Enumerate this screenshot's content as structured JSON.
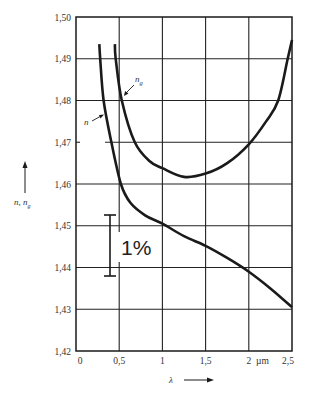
{
  "chart_data": {
    "type": "line",
    "title": "",
    "xlabel": "λ",
    "xunit": "µm",
    "ylabel": "n, n_g",
    "xlim": [
      0,
      2.5
    ],
    "ylim": [
      1.42,
      1.5
    ],
    "grid": true,
    "legend": "inline labels with arrows",
    "x_ticks": [
      "0",
      "0,5",
      "1",
      "1,5",
      "2",
      "2,5"
    ],
    "x_tick_values": [
      0,
      0.5,
      1,
      1.5,
      2,
      2.5
    ],
    "y_ticks": [
      "1,42",
      "1,43",
      "1,44",
      "1,45",
      "1,46",
      "1,47",
      "1,48",
      "1,49",
      "1,50"
    ],
    "y_tick_values": [
      1.42,
      1.43,
      1.44,
      1.45,
      1.46,
      1.47,
      1.48,
      1.49,
      1.5
    ],
    "series": [
      {
        "name": "n",
        "label": "n",
        "x": [
          0.27,
          0.28,
          0.32,
          0.41,
          0.52,
          0.63,
          0.8,
          1.0,
          1.25,
          1.5,
          1.75,
          2.0,
          2.25,
          2.5
        ],
        "y": [
          1.4935,
          1.49,
          1.48,
          1.47,
          1.46,
          1.4555,
          1.4525,
          1.4505,
          1.4475,
          1.4452,
          1.4423,
          1.439,
          1.435,
          1.4305
        ]
      },
      {
        "name": "n_g",
        "label": "n",
        "label_sub": "g",
        "x": [
          0.45,
          0.46,
          0.53,
          0.68,
          0.85,
          1.0,
          1.25,
          1.5,
          1.75,
          2.0,
          2.2,
          2.34,
          2.45,
          2.5
        ],
        "y": [
          1.4935,
          1.49,
          1.48,
          1.47,
          1.4655,
          1.4638,
          1.4617,
          1.4625,
          1.465,
          1.4695,
          1.475,
          1.48,
          1.49,
          1.4945
        ]
      }
    ],
    "annotations": [
      {
        "text": "1%",
        "type": "scale-bar",
        "x": 0.4,
        "y_range": [
          1.4383,
          1.4528
        ]
      }
    ]
  },
  "labels": {
    "y_axis_main": "n, n",
    "y_axis_sub": "g",
    "x_axis": "λ",
    "x_unit": "µm",
    "n_label": "n",
    "ng_label": "n",
    "ng_sub": "g",
    "scale_label": "1%"
  },
  "colors": {
    "ink": "#1a1a1a",
    "grid": "#222222",
    "text": "#333333",
    "background": "#ffffff"
  }
}
